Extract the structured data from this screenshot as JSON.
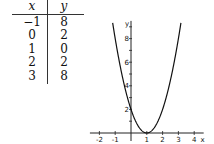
{
  "table": {
    "headers": [
      "x",
      "y"
    ],
    "rows": [
      [
        "−1",
        "8"
      ],
      [
        "0",
        "2"
      ],
      [
        "1",
        "0"
      ],
      [
        "2",
        "2"
      ],
      [
        "3",
        "8"
      ]
    ]
  },
  "chart_data": {
    "type": "line",
    "title": "",
    "xlabel": "x",
    "ylabel": "y",
    "function": "y = 2(x - 1)^2",
    "x": [
      -1,
      0,
      1,
      2,
      3
    ],
    "series": [
      {
        "name": "y = 2(x-1)^2",
        "values": [
          8,
          2,
          0,
          2,
          8
        ]
      }
    ],
    "x_ticks": [
      "-2",
      "-1",
      "1",
      "2",
      "3",
      "4"
    ],
    "y_ticks": [
      "2",
      "4",
      "6",
      "8"
    ],
    "xlim": [
      -2.6,
      4.6
    ],
    "ylim": [
      0,
      9.5
    ],
    "grid": false,
    "legend": "none"
  }
}
